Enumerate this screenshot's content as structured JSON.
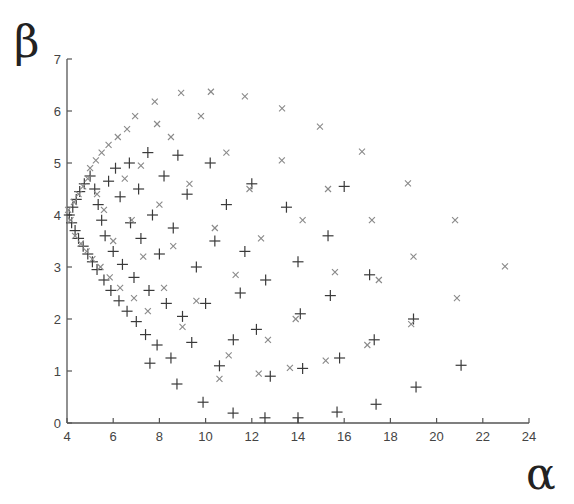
{
  "chart_data": {
    "type": "scatter",
    "title": "",
    "xlabel": "α",
    "ylabel": "β",
    "xlim": [
      4,
      24
    ],
    "ylim": [
      0,
      7
    ],
    "xticks": [
      4,
      6,
      8,
      10,
      12,
      14,
      16,
      18,
      20,
      22,
      24
    ],
    "yticks": [
      0,
      1,
      2,
      3,
      4,
      5,
      6,
      7
    ],
    "grid": false,
    "legend": null,
    "colors": {
      "axis": "#555555",
      "plus": "#3a3a3a",
      "cross": "#8a8a8a"
    },
    "series": [
      {
        "name": "plus",
        "marker": "+",
        "points": [
          [
            4.1,
            4.0
          ],
          [
            4.2,
            3.85
          ],
          [
            4.25,
            4.15
          ],
          [
            4.35,
            3.7
          ],
          [
            4.4,
            4.3
          ],
          [
            4.5,
            3.55
          ],
          [
            4.55,
            4.45
          ],
          [
            4.7,
            3.4
          ],
          [
            4.75,
            4.6
          ],
          [
            4.9,
            3.25
          ],
          [
            5.0,
            4.75
          ],
          [
            5.1,
            3.1
          ],
          [
            5.2,
            4.5
          ],
          [
            5.3,
            2.95
          ],
          [
            5.35,
            4.2
          ],
          [
            5.5,
            3.9
          ],
          [
            5.6,
            2.75
          ],
          [
            5.65,
            3.6
          ],
          [
            5.8,
            4.65
          ],
          [
            5.9,
            2.55
          ],
          [
            6.0,
            3.3
          ],
          [
            6.1,
            4.9
          ],
          [
            6.25,
            2.35
          ],
          [
            6.3,
            4.35
          ],
          [
            6.4,
            3.05
          ],
          [
            6.6,
            2.15
          ],
          [
            6.7,
            5.0
          ],
          [
            6.75,
            3.85
          ],
          [
            6.9,
            2.8
          ],
          [
            7.0,
            1.95
          ],
          [
            7.1,
            4.5
          ],
          [
            7.2,
            3.55
          ],
          [
            7.4,
            1.7
          ],
          [
            7.5,
            5.2
          ],
          [
            7.55,
            2.55
          ],
          [
            7.7,
            4.0
          ],
          [
            7.9,
            1.5
          ],
          [
            8.0,
            3.25
          ],
          [
            8.2,
            4.75
          ],
          [
            8.3,
            2.3
          ],
          [
            8.5,
            1.25
          ],
          [
            8.6,
            3.75
          ],
          [
            8.8,
            5.15
          ],
          [
            9.0,
            2.05
          ],
          [
            9.2,
            4.4
          ],
          [
            9.4,
            1.55
          ],
          [
            9.6,
            3.0
          ],
          [
            10.0,
            2.3
          ],
          [
            10.2,
            5.0
          ],
          [
            10.4,
            3.5
          ],
          [
            10.6,
            1.1
          ],
          [
            10.9,
            4.2
          ],
          [
            11.2,
            1.6
          ],
          [
            11.5,
            2.5
          ],
          [
            11.7,
            3.3
          ],
          [
            12.0,
            4.6
          ],
          [
            12.2,
            1.8
          ],
          [
            12.6,
            2.75
          ],
          [
            12.8,
            0.9
          ],
          [
            13.5,
            4.15
          ],
          [
            14.0,
            3.1
          ],
          [
            14.1,
            2.1
          ],
          [
            14.2,
            1.05
          ],
          [
            15.3,
            3.6
          ],
          [
            15.4,
            2.45
          ],
          [
            15.8,
            1.25
          ],
          [
            16.0,
            4.55
          ],
          [
            17.1,
            2.85
          ],
          [
            17.3,
            1.6
          ],
          [
            19.0,
            2.0
          ],
          [
            7.59,
            1.15
          ],
          [
            8.76,
            0.75
          ],
          [
            9.89,
            0.4
          ],
          [
            11.19,
            0.19
          ],
          [
            12.57,
            0.1
          ],
          [
            14.0,
            0.1
          ],
          [
            15.69,
            0.21
          ],
          [
            17.38,
            0.36
          ],
          [
            19.11,
            0.69
          ],
          [
            21.06,
            1.11
          ]
        ]
      },
      {
        "name": "cross",
        "marker": "x",
        "points": [
          [
            4.05,
            4.1
          ],
          [
            4.15,
            3.9
          ],
          [
            4.3,
            4.25
          ],
          [
            4.35,
            3.6
          ],
          [
            4.5,
            4.4
          ],
          [
            4.6,
            3.45
          ],
          [
            4.7,
            4.55
          ],
          [
            4.85,
            3.3
          ],
          [
            4.9,
            4.7
          ],
          [
            5.0,
            4.9
          ],
          [
            5.1,
            3.15
          ],
          [
            5.25,
            5.05
          ],
          [
            5.3,
            4.4
          ],
          [
            5.45,
            3.0
          ],
          [
            5.5,
            5.2
          ],
          [
            5.6,
            4.1
          ],
          [
            5.8,
            5.35
          ],
          [
            5.85,
            2.8
          ],
          [
            6.0,
            3.5
          ],
          [
            6.2,
            5.5
          ],
          [
            6.3,
            2.6
          ],
          [
            6.5,
            4.7
          ],
          [
            6.6,
            5.65
          ],
          [
            6.8,
            3.9
          ],
          [
            6.9,
            2.4
          ],
          [
            6.95,
            5.9
          ],
          [
            7.2,
            4.95
          ],
          [
            7.3,
            3.2
          ],
          [
            7.5,
            2.15
          ],
          [
            7.8,
            6.18
          ],
          [
            7.9,
            5.75
          ],
          [
            8.0,
            4.2
          ],
          [
            8.2,
            2.6
          ],
          [
            8.5,
            5.5
          ],
          [
            8.6,
            3.4
          ],
          [
            8.94,
            6.35
          ],
          [
            9.0,
            1.85
          ],
          [
            9.3,
            4.6
          ],
          [
            9.6,
            2.35
          ],
          [
            9.8,
            5.9
          ],
          [
            10.23,
            6.37
          ],
          [
            10.4,
            3.75
          ],
          [
            10.9,
            5.2
          ],
          [
            11.0,
            1.3
          ],
          [
            11.3,
            2.85
          ],
          [
            11.7,
            6.28
          ],
          [
            11.9,
            4.5
          ],
          [
            12.4,
            3.55
          ],
          [
            12.7,
            1.6
          ],
          [
            13.31,
            6.05
          ],
          [
            13.3,
            5.05
          ],
          [
            13.9,
            2.0
          ],
          [
            14.2,
            3.9
          ],
          [
            14.95,
            5.7
          ],
          [
            15.2,
            1.2
          ],
          [
            15.3,
            4.5
          ],
          [
            15.6,
            2.9
          ],
          [
            16.77,
            5.22
          ],
          [
            17.0,
            1.5
          ],
          [
            17.2,
            3.9
          ],
          [
            17.5,
            2.75
          ],
          [
            18.76,
            4.61
          ],
          [
            18.9,
            1.9
          ],
          [
            19.0,
            3.2
          ],
          [
            20.8,
            3.9
          ],
          [
            20.88,
            2.4
          ],
          [
            22.96,
            3.01
          ],
          [
            13.65,
            1.06
          ],
          [
            12.3,
            0.95
          ],
          [
            10.6,
            0.85
          ]
        ]
      }
    ]
  }
}
